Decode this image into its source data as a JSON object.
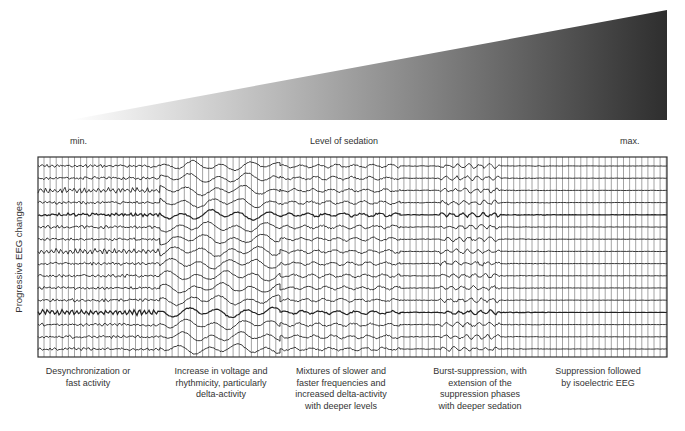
{
  "header": {
    "min_label": "min.",
    "axis_label": "Level of sedation",
    "max_label": "max."
  },
  "y_axis_label": "Progressive EEG changes",
  "wedge": {
    "color_light": "#ffffff",
    "color_dark": "#333333"
  },
  "traces": {
    "count": 16,
    "top": 166,
    "spacing": 12.2,
    "box": {
      "x": 38,
      "y": 157,
      "w": 629,
      "h": 200
    }
  },
  "stages": [
    {
      "id": "desync",
      "caption_lines": [
        "Desynchronization or",
        "fast activity"
      ],
      "x_start": 38,
      "x_end": 160,
      "style": "fast"
    },
    {
      "id": "delta",
      "caption_lines": [
        "Increase in voltage and",
        "rhythmicity, particularly",
        "delta-activity"
      ],
      "x_start": 160,
      "x_end": 280,
      "style": "delta"
    },
    {
      "id": "mixed",
      "caption_lines": [
        "Mixtures of slower and",
        "faster frequencies and",
        "increased delta-activity",
        "with deeper levels"
      ],
      "x_start": 280,
      "x_end": 400,
      "style": "mixed"
    },
    {
      "id": "burst",
      "caption_lines": [
        "Burst-suppression, with",
        "extension of the",
        "suppression phases",
        "with deeper sedation"
      ],
      "x_start": 400,
      "x_end": 550,
      "style": "burst"
    },
    {
      "id": "iso",
      "caption_lines": [
        "Suppression followed",
        "by isoelectric EEG"
      ],
      "x_start": 550,
      "x_end": 667,
      "style": "flat"
    }
  ]
}
